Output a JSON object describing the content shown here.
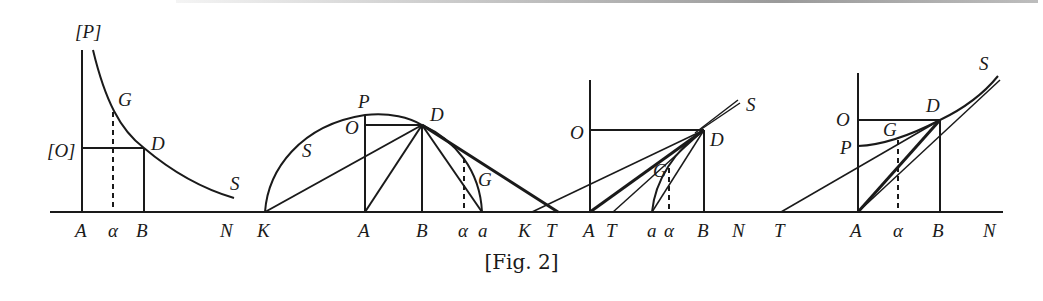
{
  "figure": {
    "caption": "[Fig. 2]",
    "panels": [
      {
        "id": "panel-1",
        "description": "Decreasing curve PGDS over axis AN with rectangle AODB",
        "labels": {
          "P": "[P]",
          "O": "[O]",
          "G": "G",
          "D": "D",
          "S": "S",
          "A": "A",
          "alpha": "α",
          "B": "B",
          "N": "N"
        }
      },
      {
        "id": "panel-2",
        "description": "Semicircle-like curve KPDGa with tangent DT and chords from D",
        "labels": {
          "P": "P",
          "O": "O",
          "D": "D",
          "S": "S",
          "G": "G",
          "K": "K",
          "A": "A",
          "B": "B",
          "alpha": "α",
          "a": "a",
          "K2": "K",
          "T": "T"
        }
      },
      {
        "id": "panel-3",
        "description": "Curve aGD with tangents through D to axis, rectangle AODB",
        "labels": {
          "O": "O",
          "D": "D",
          "S": "S",
          "G": "G",
          "A": "A",
          "T": "T",
          "a": "a",
          "alpha": "α",
          "B": "B",
          "N": "N"
        }
      },
      {
        "id": "panel-4",
        "description": "Increasing curve PGDS with tangent TD, rectangle AODB",
        "labels": {
          "T": "T",
          "O": "O",
          "P": "P",
          "G": "G",
          "D": "D",
          "S": "S",
          "A": "A",
          "alpha": "α",
          "B": "B",
          "N": "N"
        }
      }
    ]
  }
}
